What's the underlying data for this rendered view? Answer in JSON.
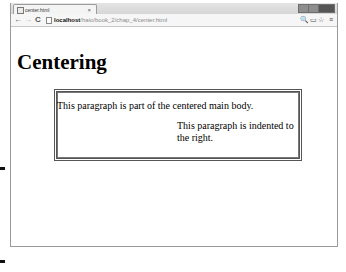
{
  "browser": {
    "tab": {
      "title": "center.html",
      "close": "×"
    },
    "nav": {
      "back": "←",
      "forward": "→",
      "reload": "C"
    },
    "address": {
      "host": "localhost",
      "path": "/haio/book_2/chap_4/center.html"
    },
    "toolbar_icons": {
      "zoom": "🔍",
      "page": "▭",
      "star": "☆",
      "menu": "≡"
    }
  },
  "page": {
    "heading": "Centering",
    "paragraph_main": "This paragraph is part of the centered main body.",
    "paragraph_indented": "This paragraph is indented to the right."
  }
}
